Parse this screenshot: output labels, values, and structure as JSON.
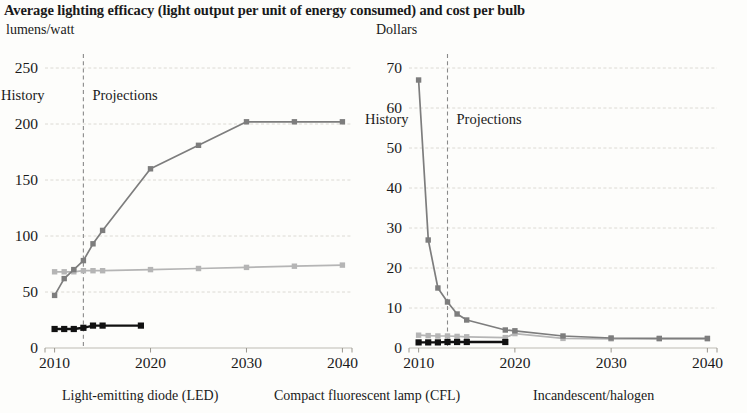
{
  "title": "Average lighting efficacy (light output per unit of energy consumed) and cost per bulb",
  "units": {
    "left": "lumens/watt",
    "right": "Dollars"
  },
  "annotations": {
    "history": "History",
    "projections": "Projections"
  },
  "legend": {
    "led": "Light-emitting diode (LED)",
    "cfl": "Compact fluorescent lamp (CFL)",
    "incandescent": "Incandescent/halogen"
  },
  "colors": {
    "led": "#7d7d7d",
    "cfl": "#b5b5b5",
    "incandescent": "#111111",
    "grid": "#d8d6cf",
    "divider": "#8a8a8a"
  },
  "chart_data": [
    {
      "type": "line",
      "title": "Average lighting efficacy",
      "ylabel": "lumens/watt",
      "xlabel": "",
      "xlim": [
        2009,
        2041
      ],
      "ylim": [
        0,
        250
      ],
      "yticks": [
        0,
        50,
        100,
        150,
        200,
        250
      ],
      "xticks": [
        2010,
        2020,
        2030,
        2040
      ],
      "grid": true,
      "history_projection_split": 2013,
      "legend_position": "below",
      "series": [
        {
          "name": "Light-emitting diode (LED)",
          "color": "#7d7d7d",
          "x": [
            2010,
            2011,
            2012,
            2013,
            2014,
            2015,
            2020,
            2025,
            2030,
            2035,
            2040
          ],
          "values": [
            47,
            62,
            70,
            78,
            93,
            105,
            160,
            181,
            202,
            202,
            202
          ]
        },
        {
          "name": "Compact fluorescent lamp (CFL)",
          "color": "#b5b5b5",
          "x": [
            2010,
            2011,
            2012,
            2013,
            2014,
            2015,
            2020,
            2025,
            2030,
            2035,
            2040
          ],
          "values": [
            68,
            68,
            68,
            69,
            69,
            69,
            70,
            71,
            72,
            73,
            74
          ]
        },
        {
          "name": "Incandescent/halogen",
          "color": "#111111",
          "x": [
            2010,
            2011,
            2012,
            2013,
            2014,
            2015,
            2019
          ],
          "values": [
            17,
            17,
            17,
            18,
            20,
            20,
            20
          ]
        }
      ]
    },
    {
      "type": "line",
      "title": "Cost per bulb",
      "ylabel": "Dollars",
      "xlabel": "",
      "xlim": [
        2009,
        2041
      ],
      "ylim": [
        0,
        70
      ],
      "yticks": [
        0,
        10,
        20,
        30,
        40,
        50,
        60,
        70
      ],
      "xticks": [
        2010,
        2020,
        2030,
        2040
      ],
      "grid": true,
      "history_projection_split": 2013,
      "legend_position": "below",
      "series": [
        {
          "name": "Light-emitting diode (LED)",
          "color": "#7d7d7d",
          "x": [
            2010,
            2011,
            2012,
            2013,
            2014,
            2015,
            2019,
            2020,
            2025,
            2030,
            2035,
            2040
          ],
          "values": [
            67,
            27,
            15,
            11.5,
            8.5,
            7,
            4.5,
            4.3,
            3.0,
            2.5,
            2.4,
            2.4
          ]
        },
        {
          "name": "Compact fluorescent lamp (CFL)",
          "color": "#b5b5b5",
          "x": [
            2010,
            2011,
            2012,
            2013,
            2014,
            2015,
            2019,
            2020,
            2025,
            2030,
            2035,
            2040
          ],
          "values": [
            3.2,
            3.1,
            3.0,
            3.0,
            2.9,
            2.8,
            2.6,
            3.6,
            2.4,
            2.3,
            2.3,
            2.3
          ]
        },
        {
          "name": "Incandescent/halogen",
          "color": "#111111",
          "x": [
            2010,
            2011,
            2012,
            2013,
            2014,
            2015,
            2019
          ],
          "values": [
            1.4,
            1.4,
            1.4,
            1.5,
            1.5,
            1.5,
            1.5
          ]
        }
      ]
    }
  ]
}
